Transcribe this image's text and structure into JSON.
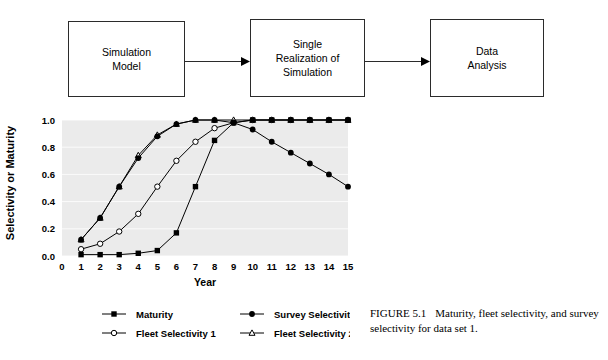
{
  "diagram": {
    "boxes": [
      {
        "id": "simulation-model",
        "label": "Simulation\nModel"
      },
      {
        "id": "single-realization",
        "label": "Single\nRealization of\nSimulation"
      },
      {
        "id": "data-analysis",
        "label": "Data\nAnalysis"
      }
    ],
    "arrows": [
      {
        "id": "arrow-1",
        "name": "arrow-right-icon"
      },
      {
        "id": "arrow-2",
        "name": "arrow-right-icon"
      }
    ]
  },
  "chart_data": {
    "type": "line",
    "title": "",
    "xlabel": "Year",
    "ylabel": "Selectivity or Maturity",
    "xlim": [
      0,
      15
    ],
    "ylim": [
      0.0,
      1.0
    ],
    "xticks": [
      0,
      1,
      2,
      3,
      4,
      5,
      6,
      7,
      8,
      9,
      10,
      11,
      12,
      13,
      14,
      15
    ],
    "xtick_labels": [
      "0",
      "1",
      "2",
      "3",
      "4",
      "5",
      "6",
      "7",
      "8",
      "9",
      "10",
      "11",
      "12",
      "13",
      "14",
      "15"
    ],
    "yticks": [
      0.0,
      0.2,
      0.4,
      0.6,
      0.8,
      1.0
    ],
    "ytick_labels": [
      "0.0",
      "0.2",
      "0.4",
      "0.6",
      "0.8",
      "1.0"
    ],
    "grid": true,
    "grid_axis": "y",
    "plot_background": "#ebebeb",
    "legend_position": "below",
    "x": [
      1,
      2,
      3,
      4,
      5,
      6,
      7,
      8,
      9,
      10,
      11,
      12,
      13,
      14,
      15
    ],
    "series": [
      {
        "name": "Maturity",
        "marker": "filled-square",
        "color": "#000000",
        "values": [
          0.01,
          0.01,
          0.01,
          0.02,
          0.04,
          0.17,
          0.51,
          0.85,
          0.98,
          1.0,
          1.0,
          1.0,
          1.0,
          1.0,
          1.0
        ]
      },
      {
        "name": "Fleet Selectivity 1",
        "marker": "open-circle",
        "color": "#000000",
        "values": [
          0.05,
          0.09,
          0.18,
          0.31,
          0.51,
          0.7,
          0.84,
          0.94,
          0.98,
          1.0,
          1.0,
          1.0,
          1.0,
          1.0,
          1.0
        ]
      },
      {
        "name": "Survey Selectivity",
        "marker": "filled-circle",
        "color": "#000000",
        "values": [
          0.12,
          0.28,
          0.51,
          0.72,
          0.88,
          0.97,
          1.0,
          1.0,
          0.98,
          0.93,
          0.84,
          0.76,
          0.68,
          0.6,
          0.51
        ]
      },
      {
        "name": "Fleet Selectivity 2",
        "marker": "open-triangle",
        "color": "#000000",
        "values": [
          0.12,
          0.28,
          0.51,
          0.74,
          0.89,
          0.97,
          1.0,
          1.0,
          1.0,
          1.0,
          1.0,
          1.0,
          1.0,
          1.0,
          1.0
        ]
      }
    ]
  },
  "legend": {
    "entries": [
      {
        "label": "Maturity",
        "marker": "filled-square"
      },
      {
        "label": "Survey Selectivity",
        "marker": "filled-circle"
      },
      {
        "label": "Fleet Selectivity 1",
        "marker": "open-circle"
      },
      {
        "label": "Fleet Selectivity 2",
        "marker": "open-triangle"
      }
    ]
  },
  "caption": {
    "label": "FIGURE 5.1",
    "text": "Maturity, fleet selectivity, and survey selectivity for data set 1."
  }
}
